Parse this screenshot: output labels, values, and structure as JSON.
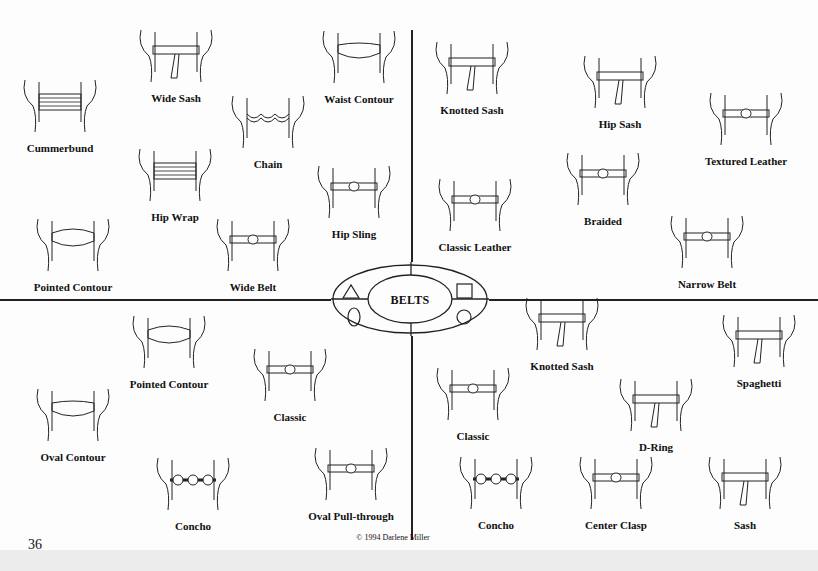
{
  "document": {
    "title": "BELTS",
    "page_number": "36",
    "copyright": "© 1994 Darlene Miller",
    "colors": {
      "ink": "#111111",
      "paper": "#fdfdfd"
    },
    "emblem_shapes": [
      "triangle",
      "square",
      "oval",
      "circle"
    ]
  },
  "quadrants": {
    "top_left": {
      "items": [
        {
          "label": "Cummerbund",
          "x": 60,
          "y": 150,
          "style": "wide-striped"
        },
        {
          "label": "Wide Sash",
          "x": 176,
          "y": 100,
          "style": "sash-bow"
        },
        {
          "label": "Waist Contour",
          "x": 359,
          "y": 101,
          "style": "contour"
        },
        {
          "label": "Chain",
          "x": 268,
          "y": 166,
          "style": "chain"
        },
        {
          "label": "Hip Wrap",
          "x": 175,
          "y": 219,
          "style": "wrap"
        },
        {
          "label": "Hip Sling",
          "x": 354,
          "y": 236,
          "style": "sling"
        },
        {
          "label": "Pointed Contour",
          "x": 73,
          "y": 289,
          "style": "pointed"
        },
        {
          "label": "Wide Belt",
          "x": 253,
          "y": 289,
          "style": "wide-buckle"
        }
      ]
    },
    "top_right": {
      "items": [
        {
          "label": "Knotted Sash",
          "x": 472,
          "y": 112,
          "style": "knot"
        },
        {
          "label": "Hip Sash",
          "x": 620,
          "y": 126,
          "style": "sash-tail"
        },
        {
          "label": "Textured Leather",
          "x": 746,
          "y": 163,
          "style": "textured"
        },
        {
          "label": "Braided",
          "x": 603,
          "y": 223,
          "style": "braided"
        },
        {
          "label": "Classic Leather",
          "x": 475,
          "y": 249,
          "style": "leather"
        },
        {
          "label": "Narrow Belt",
          "x": 707,
          "y": 286,
          "style": "narrow"
        }
      ]
    },
    "bottom_left": {
      "items": [
        {
          "label": "Pointed Contour",
          "x": 169,
          "y": 386,
          "style": "pointed"
        },
        {
          "label": "Classic",
          "x": 290,
          "y": 419,
          "style": "classic-oval"
        },
        {
          "label": "Oval Contour",
          "x": 73,
          "y": 459,
          "style": "oval"
        },
        {
          "label": "Concho",
          "x": 193,
          "y": 528,
          "style": "concho"
        },
        {
          "label": "Oval Pull-through",
          "x": 351,
          "y": 518,
          "style": "pull-through"
        }
      ]
    },
    "bottom_right": {
      "items": [
        {
          "label": "Knotted Sash",
          "x": 562,
          "y": 368,
          "style": "knot"
        },
        {
          "label": "Spaghetti",
          "x": 759,
          "y": 385,
          "style": "spaghetti"
        },
        {
          "label": "Classic",
          "x": 473,
          "y": 438,
          "style": "classic-buckle"
        },
        {
          "label": "D-Ring",
          "x": 656,
          "y": 449,
          "style": "d-ring"
        },
        {
          "label": "Concho",
          "x": 496,
          "y": 527,
          "style": "concho"
        },
        {
          "label": "Center Clasp",
          "x": 616,
          "y": 527,
          "style": "clasp"
        },
        {
          "label": "Sash",
          "x": 745,
          "y": 527,
          "style": "sash-tie"
        }
      ]
    }
  }
}
